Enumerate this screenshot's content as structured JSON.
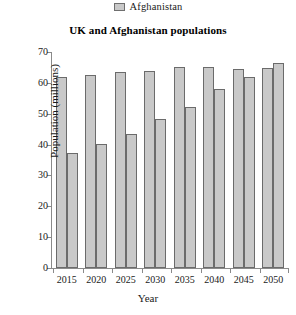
{
  "legend": {
    "position": "top-center",
    "entries": [
      {
        "label": "Afghanistan",
        "swatch_icon": "legend-swatch-icon",
        "color": "#c9c9c9"
      }
    ]
  },
  "axis": {
    "y_title": "Population (millions)",
    "x_title": "Year",
    "y_ticks": [
      "0",
      "10",
      "20",
      "30",
      "40",
      "50",
      "60",
      "70"
    ],
    "x_ticks": [
      "2015",
      "2020",
      "2025",
      "2030",
      "2035",
      "2040",
      "2045",
      "2050"
    ]
  },
  "chart_data": {
    "type": "bar",
    "title": "UK and Afghanistan populations",
    "xlabel": "Year",
    "ylabel": "Population (millions)",
    "categories": [
      "2015",
      "2020",
      "2025",
      "2030",
      "2035",
      "2040",
      "2045",
      "2050"
    ],
    "series": [
      {
        "name": "UK",
        "color": "#c9c9c9",
        "values": [
          61.8,
          62.7,
          63.6,
          63.8,
          65.0,
          65.2,
          64.5,
          64.8
        ]
      },
      {
        "name": "Afghanistan",
        "color": "#c9c9c9",
        "values": [
          37.2,
          40.2,
          43.5,
          48.4,
          52.3,
          58.0,
          61.8,
          66.5
        ]
      }
    ],
    "ylim": [
      0,
      70
    ],
    "ytick_step": 10,
    "grid": false,
    "legend_position": "top-center",
    "legend_entries": [
      "Afghanistan"
    ],
    "bar_fill": "#c9c9c9",
    "bar_stroke": "#6b6b6b"
  }
}
